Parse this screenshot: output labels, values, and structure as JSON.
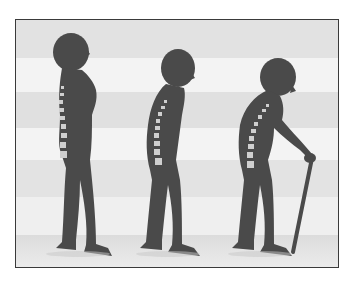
{
  "image": {
    "description": "Illustration of three human silhouettes showing progressive spinal curvature (posture degeneration), the last figure stooped and using a walking cane",
    "figures": [
      {
        "stage": "upright",
        "spine_visible": true,
        "has_cane": false
      },
      {
        "stage": "slightly-stooped",
        "spine_visible": true,
        "has_cane": false
      },
      {
        "stage": "severely-stooped",
        "spine_visible": true,
        "has_cane": true
      }
    ],
    "colors": {
      "silhouette": "#4a4a4a",
      "spine": "#cfcfcf",
      "band_light": "#f2f2f2",
      "band_dark": "#e0e0e0",
      "border": "#3a3a3a"
    }
  }
}
